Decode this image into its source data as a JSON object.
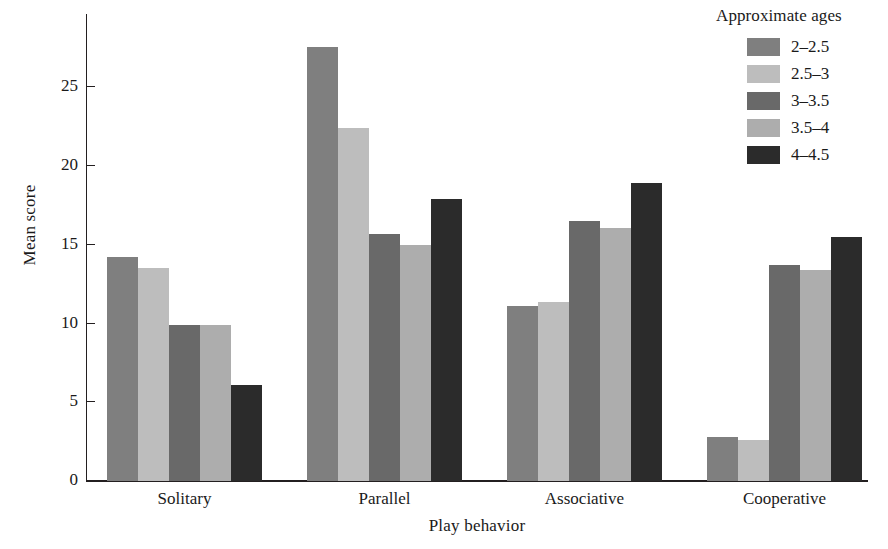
{
  "chart_data": {
    "type": "bar",
    "title": "",
    "xlabel": "Play behavior",
    "ylabel": "Mean score",
    "categories": [
      "Solitary",
      "Parallel",
      "Associative",
      "Cooperative"
    ],
    "series": [
      {
        "name": "2–2.5",
        "color": "#7f7f7f",
        "values": [
          14.2,
          27.6,
          11.1,
          2.8
        ]
      },
      {
        "name": "2.5–3",
        "color": "#bdbdbd",
        "values": [
          13.5,
          22.4,
          11.4,
          2.6
        ]
      },
      {
        "name": "3–3.5",
        "color": "#696969",
        "values": [
          9.9,
          15.7,
          16.5,
          13.7
        ]
      },
      {
        "name": "3.5–4",
        "color": "#adadad",
        "values": [
          9.9,
          15.0,
          16.1,
          13.4
        ]
      },
      {
        "name": "4–4.5",
        "color": "#2b2b2b",
        "values": [
          6.1,
          17.9,
          18.9,
          15.5
        ]
      }
    ],
    "ylim": [
      0,
      29.6
    ],
    "yticks": [
      0,
      5,
      10,
      15,
      20,
      25
    ],
    "ytick_labels": [
      "0",
      "5",
      "10",
      "15",
      "20",
      "25"
    ],
    "grid": false,
    "legend": {
      "title": "Approximate ages",
      "position": "top-right"
    }
  }
}
